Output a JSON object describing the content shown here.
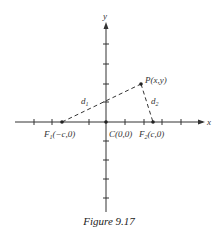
{
  "figure": {
    "caption": "Figure 9.17",
    "axes": {
      "x_label": "x",
      "y_label": "y"
    },
    "points": {
      "P": {
        "label": "P(x,y)"
      },
      "C": {
        "label": "C(0,0)"
      },
      "F1": {
        "label_main": "F",
        "label_sub": "1",
        "label_rest": "(−c,0)"
      },
      "F2": {
        "label_main": "F",
        "label_sub": "2",
        "label_rest": "(c,0)"
      }
    },
    "distances": {
      "d1": {
        "main": "d",
        "sub": "1"
      },
      "d2": {
        "main": "d",
        "sub": "2"
      }
    },
    "colors": {
      "line": "#333333",
      "text": "#333333"
    }
  }
}
